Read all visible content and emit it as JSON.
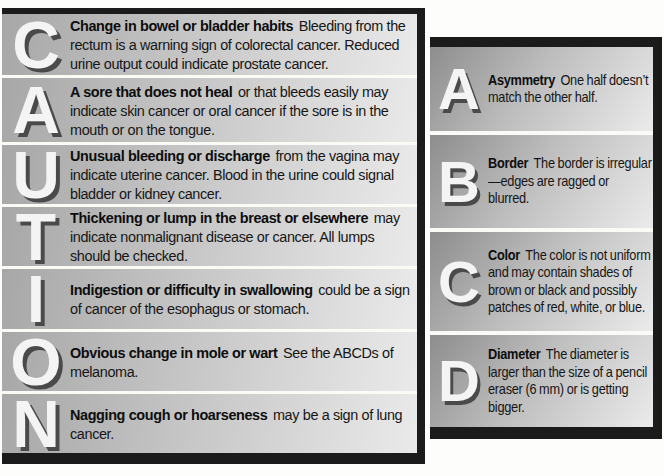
{
  "colors": {
    "bar_black": "#1b1b1b",
    "row_gradient_dark": "#8d8d8d",
    "row_gradient_light": "#ebebeb",
    "letter_fill": "#f4f4f4",
    "letter_shadow": "#4a4a4a",
    "body_text": "#161616"
  },
  "caution_panel": {
    "acronym": "CAUTION",
    "rows": [
      {
        "letter": "C",
        "lead": "Change in bowel or bladder habits",
        "rest": "Bleeding from the rectum is a warning sign of colorectal cancer. Reduced urine output could indicate prostate cancer."
      },
      {
        "letter": "A",
        "lead": "A sore that does not heal",
        "rest": "or that bleeds easily may indicate skin cancer or oral cancer if the sore is in the mouth or on the tongue."
      },
      {
        "letter": "U",
        "lead": "Unusual bleeding or discharge",
        "rest": "from the vagina may indicate uterine cancer. Blood in the urine could signal bladder or kidney cancer."
      },
      {
        "letter": "T",
        "lead": "Thickening or lump in the breast or elsewhere",
        "rest": "may indicate nonmalignant disease or cancer. All lumps should be checked."
      },
      {
        "letter": "I",
        "lead": "Indigestion or difficulty in swallowing",
        "rest": "could be a sign of cancer of the esophagus or stomach."
      },
      {
        "letter": "O",
        "lead": "Obvious change in mole or wart",
        "rest": "See the ABCDs of melanoma."
      },
      {
        "letter": "N",
        "lead": "Nagging cough or hoarseness",
        "rest": "may be a sign of lung cancer."
      }
    ]
  },
  "abcd_panel": {
    "acronym": "ABCD",
    "rows": [
      {
        "letter": "A",
        "lead": "Asymmetry",
        "rest": "One half doesn’t match the other half."
      },
      {
        "letter": "B",
        "lead": "Border",
        "rest": "The border is irregular—edges are ragged or blurred."
      },
      {
        "letter": "C",
        "lead": "Color",
        "rest": "The color is not uniform and may contain shades of brown or black and possibly patches of red, white, or blue."
      },
      {
        "letter": "D",
        "lead": "Diameter",
        "rest": "The diameter is larger than the size of a pencil eraser (6 mm) or is getting bigger."
      }
    ]
  }
}
